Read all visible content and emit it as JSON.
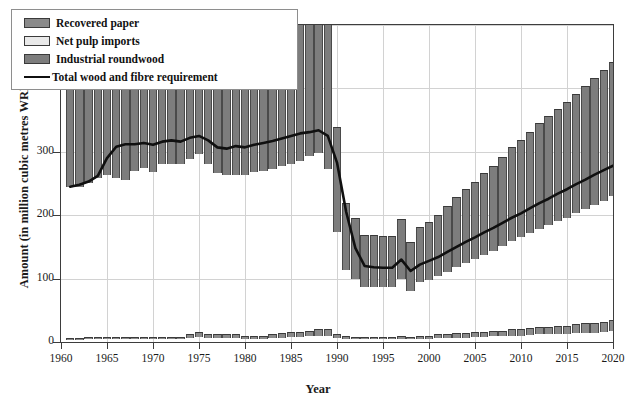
{
  "chart_data": {
    "type": "bar",
    "title": "",
    "xlabel": "Year",
    "ylabel": "Amount (in million cubic metres WRME)",
    "xlim": [
      1960,
      2020
    ],
    "ylim": [
      0,
      500
    ],
    "ytick_labels": [
      "0",
      "100",
      "200",
      "300",
      "400",
      "500"
    ],
    "ytick_values": [
      0,
      100,
      200,
      300,
      400,
      500
    ],
    "xtick_labels": [
      "1960",
      "1965",
      "1970",
      "1975",
      "1980",
      "1985",
      "1990",
      "1995",
      "2000",
      "2005",
      "2010",
      "2015",
      "2020"
    ],
    "xtick_values": [
      1960,
      1965,
      1970,
      1975,
      1980,
      1985,
      1990,
      1995,
      2000,
      2005,
      2010,
      2015,
      2020
    ],
    "grid": true,
    "legend_position": "upper-left",
    "stacked": true,
    "legend": [
      {
        "label": "Recovered paper",
        "marker": "swatch",
        "color": "#8a8a8a"
      },
      {
        "label": "Net pulp imports",
        "marker": "swatch",
        "color": "#e9e9e9"
      },
      {
        "label": "Industrial roundwood",
        "marker": "swatch",
        "color": "#7d7d7d"
      },
      {
        "label": "Total wood and fibre requirement",
        "marker": "line",
        "color": "#101010"
      }
    ],
    "x": [
      1961,
      1962,
      1963,
      1964,
      1965,
      1966,
      1967,
      1968,
      1969,
      1970,
      1971,
      1972,
      1973,
      1974,
      1975,
      1976,
      1977,
      1978,
      1979,
      1980,
      1981,
      1982,
      1983,
      1984,
      1985,
      1986,
      1987,
      1988,
      1989,
      1990,
      1991,
      1992,
      1993,
      1994,
      1995,
      1996,
      1997,
      1998,
      1999,
      2000,
      2001,
      2002,
      2003,
      2004,
      2005,
      2006,
      2007,
      2008,
      2009,
      2010,
      2011,
      2012,
      2013,
      2014,
      2015,
      2016,
      2017,
      2018,
      2019,
      2020
    ],
    "series": [
      {
        "name": "Industrial roundwood",
        "color": "#7d7d7d",
        "values": [
          240,
          240,
          246,
          253,
          259,
          254,
          250,
          265,
          270,
          263,
          276,
          275,
          275,
          281,
          287,
          274,
          259,
          256,
          257,
          258,
          262,
          264,
          266,
          270,
          272,
          276,
          283,
          287,
          262,
          166,
          107,
          95,
          82,
          82,
          81,
          81,
          94,
          76,
          88,
          92,
          97,
          104,
          110,
          117,
          122,
          129,
          134,
          141,
          148,
          154,
          160,
          166,
          172,
          177,
          182,
          188,
          194,
          200,
          206,
          212
        ]
      },
      {
        "name": "Net pulp imports",
        "color": "#e9e9e9",
        "values": [
          1,
          1,
          1,
          1,
          1,
          1,
          1,
          1,
          1,
          1,
          1,
          1,
          1,
          1,
          1,
          1,
          1,
          1,
          1,
          1,
          1,
          1,
          1,
          1,
          1,
          1,
          1,
          1,
          1,
          1,
          1,
          1,
          1,
          1,
          1,
          1,
          1,
          1,
          1,
          1,
          1,
          1,
          1,
          1,
          1,
          1,
          1,
          1,
          1,
          1,
          1,
          1,
          1,
          1,
          1,
          1,
          1,
          1,
          1,
          1
        ]
      },
      {
        "name": "Recovered paper",
        "color": "#8a8a8a",
        "values": [
          3,
          3,
          4,
          4,
          4,
          4,
          4,
          4,
          4,
          4,
          4,
          4,
          4,
          6,
          8,
          6,
          6,
          6,
          6,
          5,
          5,
          5,
          6,
          7,
          8,
          8,
          9,
          10,
          10,
          6,
          5,
          4,
          4,
          4,
          4,
          4,
          5,
          4,
          5,
          5,
          6,
          6,
          7,
          7,
          8,
          8,
          9,
          9,
          10,
          10,
          11,
          12,
          12,
          13,
          13,
          14,
          15,
          15,
          16,
          17
        ]
      }
    ],
    "line_series": {
      "name": "Total wood and fibre requirement",
      "color": "#101010",
      "values": [
        245,
        248,
        253,
        262,
        290,
        308,
        312,
        312,
        314,
        311,
        316,
        318,
        316,
        322,
        325,
        318,
        307,
        305,
        309,
        307,
        311,
        314,
        317,
        321,
        325,
        329,
        331,
        334,
        325,
        283,
        205,
        148,
        120,
        118,
        117,
        117,
        130,
        112,
        122,
        128,
        134,
        142,
        150,
        158,
        165,
        173,
        180,
        188,
        196,
        203,
        211,
        219,
        226,
        234,
        241,
        249,
        256,
        264,
        271,
        278
      ]
    }
  },
  "axes": {
    "ylabel": "Amount (in million cubic metres WRME)",
    "xlabel": "Year"
  }
}
